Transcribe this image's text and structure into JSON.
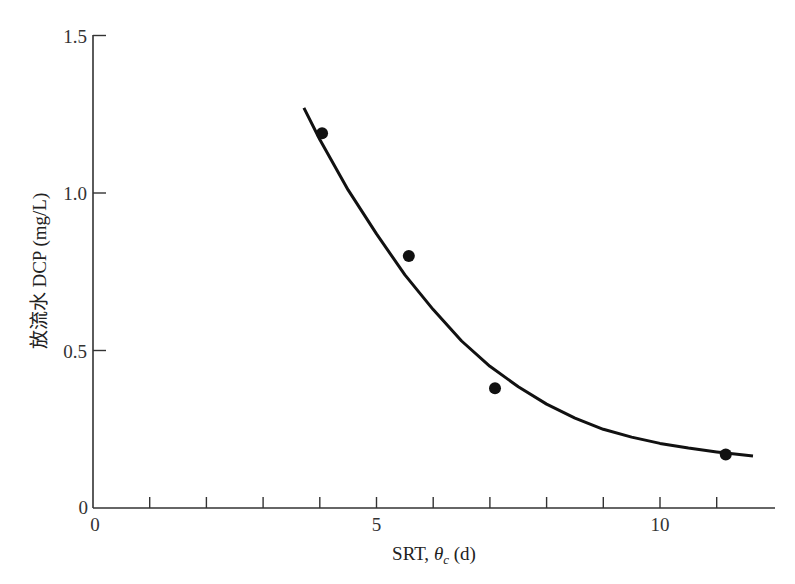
{
  "chart_data": {
    "type": "scatter",
    "title": "",
    "xlabel": "SRT, θc (d)",
    "xlabel_parts": {
      "main": "SRT, ",
      "symbol": "θ",
      "subscript": "c",
      "unit": " (d)"
    },
    "ylabel": "放流水 DCP (mg/L)",
    "xlim": [
      0,
      12
    ],
    "ylim": [
      0,
      1.5
    ],
    "x_ticks": [
      0,
      1,
      2,
      3,
      4,
      5,
      6,
      7,
      8,
      9,
      10,
      11
    ],
    "x_tick_labels": [
      {
        "value": 0,
        "label": "0"
      },
      {
        "value": 5,
        "label": "5"
      },
      {
        "value": 10,
        "label": "10"
      }
    ],
    "y_ticks": [
      0,
      0.5,
      1.0,
      1.5
    ],
    "y_tick_labels": [
      {
        "value": 0,
        "label": "0"
      },
      {
        "value": 0.5,
        "label": "0.5"
      },
      {
        "value": 1.0,
        "label": "1.0"
      },
      {
        "value": 1.5,
        "label": "1.5"
      }
    ],
    "grid": false,
    "legend": null,
    "series": [
      {
        "name": "measured",
        "kind": "scatter",
        "marker": "filled-circle",
        "color": "#111111",
        "points": [
          {
            "x": 4.04,
            "y": 1.19
          },
          {
            "x": 5.57,
            "y": 0.8
          },
          {
            "x": 7.09,
            "y": 0.38
          },
          {
            "x": 11.16,
            "y": 0.17
          }
        ]
      },
      {
        "name": "fitted-curve",
        "kind": "line",
        "color": "#111111",
        "points": [
          {
            "x": 3.72,
            "y": 1.27
          },
          {
            "x": 4.0,
            "y": 1.17
          },
          {
            "x": 4.5,
            "y": 1.01
          },
          {
            "x": 5.0,
            "y": 0.87
          },
          {
            "x": 5.5,
            "y": 0.74
          },
          {
            "x": 6.0,
            "y": 0.63
          },
          {
            "x": 6.5,
            "y": 0.53
          },
          {
            "x": 7.0,
            "y": 0.45
          },
          {
            "x": 7.5,
            "y": 0.385
          },
          {
            "x": 8.0,
            "y": 0.33
          },
          {
            "x": 8.5,
            "y": 0.285
          },
          {
            "x": 9.0,
            "y": 0.25
          },
          {
            "x": 9.5,
            "y": 0.225
          },
          {
            "x": 10.0,
            "y": 0.205
          },
          {
            "x": 10.5,
            "y": 0.19
          },
          {
            "x": 11.0,
            "y": 0.178
          },
          {
            "x": 11.64,
            "y": 0.165
          }
        ]
      }
    ]
  }
}
